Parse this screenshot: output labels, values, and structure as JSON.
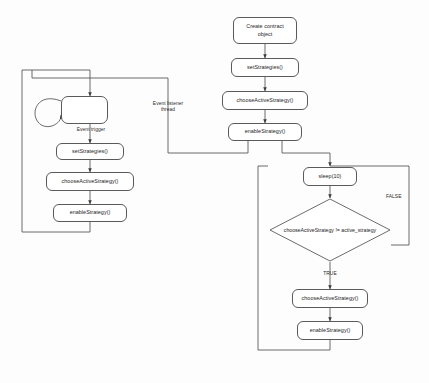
{
  "diagram": {
    "type": "flowchart",
    "background_color": "#fdfdfd",
    "stroke_color": "#5a5a5a",
    "text_color": "#1c1c1c",
    "nodes": {
      "create_contract": "Create contract\nobject",
      "set_strategies_main": "setStrategies()",
      "choose_active_main": "chooseActiveStrategy()",
      "enable_strategy_main": "enableStrategy()",
      "event_trigger_box": "",
      "set_strategies_left": "setStrategies()",
      "choose_active_left": "chooseActiveStrategy()",
      "enable_strategy_left": "enableStrategy()",
      "sleep": "sleep(10)",
      "decision": "chooseActiveStrategy != active_strategy",
      "choose_active_loop": "chooseActiveStrategy()",
      "enable_strategy_loop": "enableStrategy()"
    },
    "edge_labels": {
      "event_trigger": "Event trigger",
      "event_listener_thread": "Event listener\nthread",
      "decision_false": "FALSE",
      "decision_true": "TRUE"
    }
  }
}
